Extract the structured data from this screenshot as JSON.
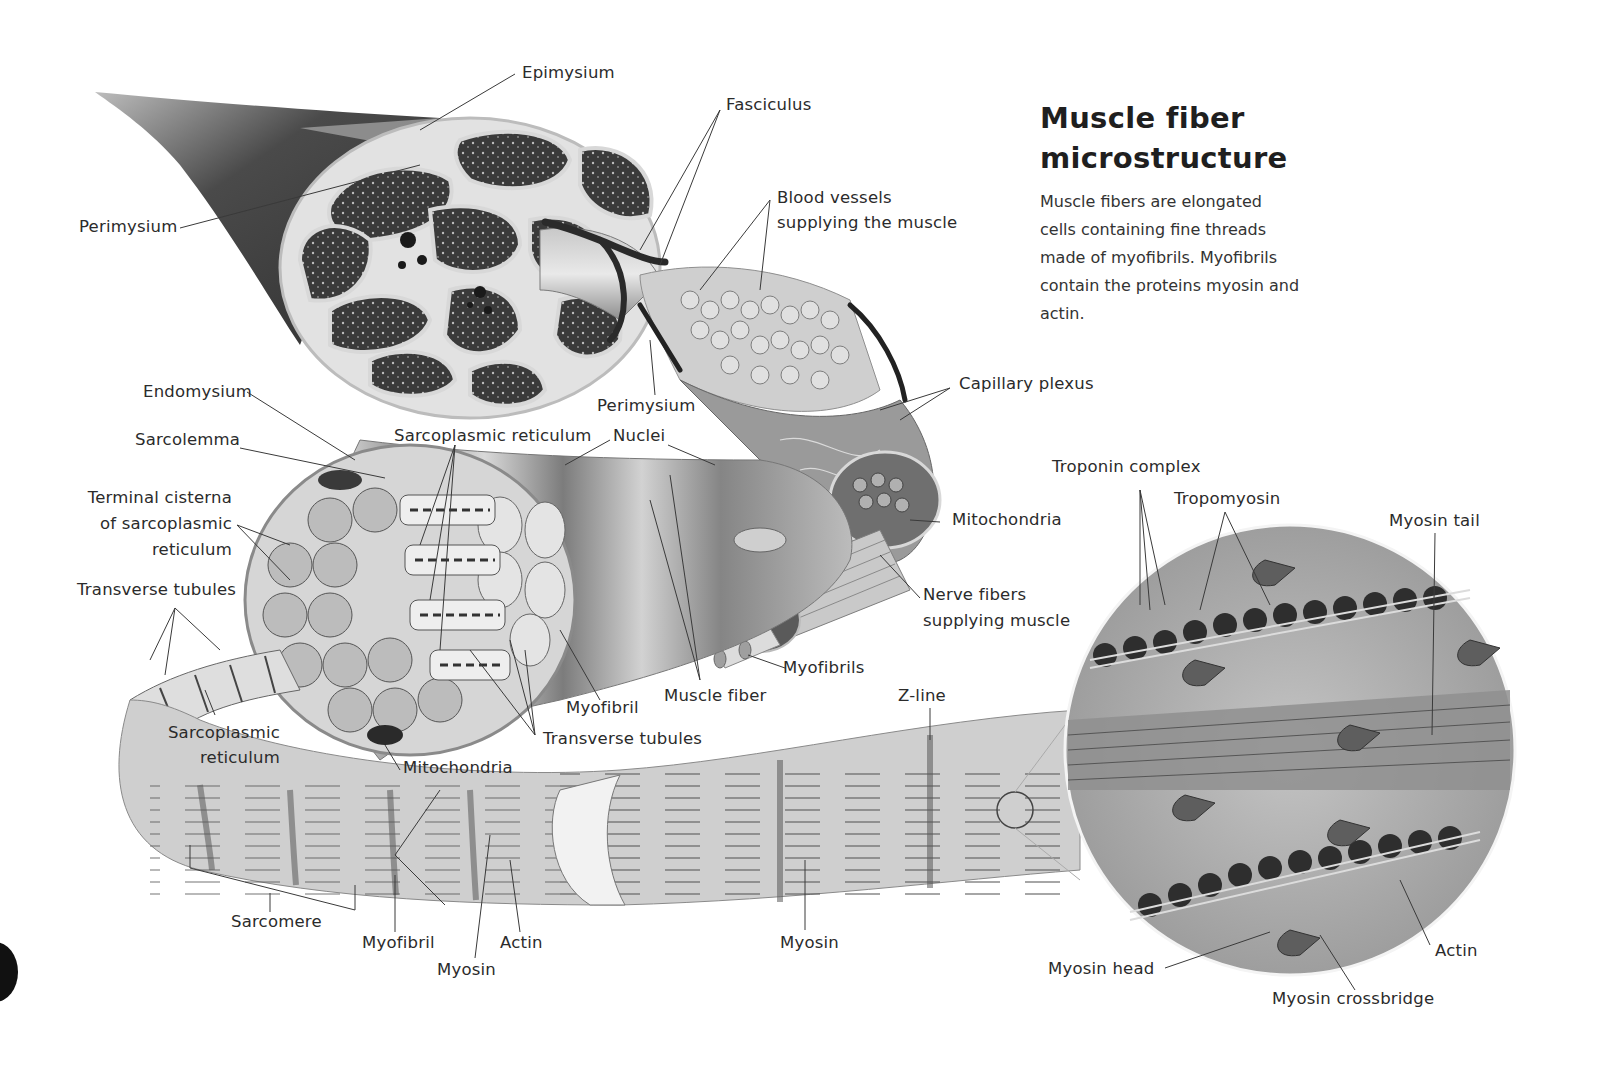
{
  "header": {
    "title": "Muscle fiber\nmicrostructure",
    "description": "Muscle fibers are elongated cells containing fine threads made of myofibrils. Myofibrils contain the proteins myosin and actin."
  },
  "colors": {
    "background": "#ffffff",
    "text": "#2b2b2b",
    "leader_line": "#3a3a3a",
    "illustration_dark": "#3b3b3b",
    "illustration_mid": "#8a8a8a",
    "illustration_light": "#d6d6d6"
  },
  "labels": {
    "epimysium": "Epimysium",
    "fasciculus": "Fasciculus",
    "perimysium_outer": "Perimysium",
    "blood_vessels": "Blood vessels\nsupplying the muscle",
    "capillary_plexus": "Capillary plexus",
    "perimysium_inner": "Perimysium",
    "endomysium": "Endomysium",
    "sarcolemma": "Sarcolemma",
    "sarcoplasmic_reticulum_top": "Sarcoplasmic reticulum",
    "nuclei": "Nuclei",
    "terminal_cisterna": "Terminal cisterna\nof sarcoplasmic\nreticulum",
    "mitochondria_right": "Mitochondria",
    "transverse_tubules_left": "Transverse tubules",
    "nerve_fibers": "Nerve fibers\nsupplying muscle",
    "myofibrils": "Myofibrils",
    "muscle_fiber": "Muscle fiber",
    "myofibril_mid": "Myofibril",
    "z_line": "Z-line",
    "sarcoplasmic_reticulum_bottom": "Sarcoplasmic\nreticulum",
    "transverse_tubules_bottom": "Transverse tubules",
    "mitochondria_bottom": "Mitochondria",
    "sarcomere": "Sarcomere",
    "myofibril_bottom": "Myofibril",
    "actin_bottom": "Actin",
    "myosin_bottom_left": "Myosin",
    "myosin_bottom_mid": "Myosin",
    "troponin_complex": "Troponin complex",
    "tropomyosin": "Tropomyosin",
    "myosin_tail": "Myosin tail",
    "myosin_head": "Myosin head",
    "actin_right": "Actin",
    "myosin_crossbridge": "Myosin crossbridge"
  }
}
